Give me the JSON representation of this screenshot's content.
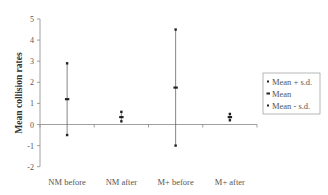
{
  "chart_data": {
    "type": "scatter",
    "subtype": "error-bar (high-low-mean)",
    "title": "",
    "xlabel": "",
    "ylabel": "Mean collision rates",
    "categories": [
      "NM before",
      "NM after",
      "M+ before",
      "M+ after"
    ],
    "series": [
      {
        "name": "Mean + s.d.",
        "values": [
          2.9,
          0.6,
          4.5,
          0.5
        ],
        "marker": "small-square"
      },
      {
        "name": "Mean",
        "values": [
          1.2,
          0.35,
          1.75,
          0.35
        ],
        "marker": "dash"
      },
      {
        "name": "Mean - s.d.",
        "values": [
          -0.5,
          0.15,
          -1.0,
          0.2
        ],
        "marker": "small-square"
      }
    ],
    "ylim": [
      -2,
      5
    ],
    "yticks": [
      5,
      4,
      3,
      2,
      1,
      0,
      -1,
      -2
    ],
    "grid": false,
    "legend_position": "right"
  },
  "colors": {
    "axis": "#888888",
    "marker": "#222222",
    "errorbar": "#666666",
    "legend_border": "#999999"
  }
}
